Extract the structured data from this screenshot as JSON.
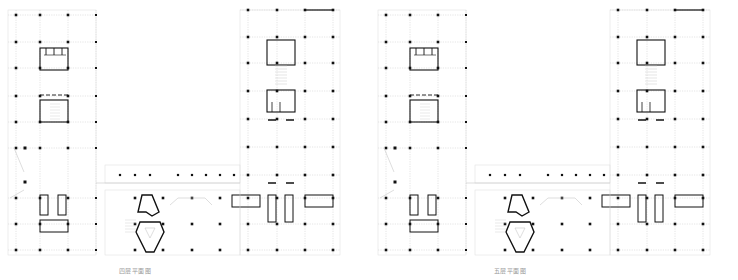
{
  "colors": {
    "ink": "#111111",
    "grid": "#c8c8c8",
    "faint": "#dcdcdc",
    "caption": "#9a9a9a"
  },
  "plans": [
    {
      "id": "floor-4",
      "caption": "四层平面图",
      "offset_x": 0,
      "caption_x": 130
    },
    {
      "id": "floor-5",
      "caption": "五层平面图",
      "offset_x": 370,
      "caption_x": 503
    }
  ],
  "geometry": {
    "left_wing_cols_x": [
      16,
      40,
      68,
      96
    ],
    "left_wing_rows_y": [
      15,
      42,
      68,
      96,
      122,
      148,
      198,
      224,
      250
    ],
    "right_wing_cols_x": [
      248,
      277,
      305,
      333
    ],
    "right_wing_rows_y": [
      10,
      37,
      63,
      91,
      119,
      147,
      175,
      198,
      224,
      250
    ],
    "bridge_cols_x": [
      120,
      135,
      150,
      178,
      192,
      206,
      220,
      234
    ],
    "bridge_y": 175,
    "bottom_cols_x": [
      135,
      163,
      192,
      220
    ],
    "bottom_rows_y": [
      198,
      224,
      250
    ]
  }
}
